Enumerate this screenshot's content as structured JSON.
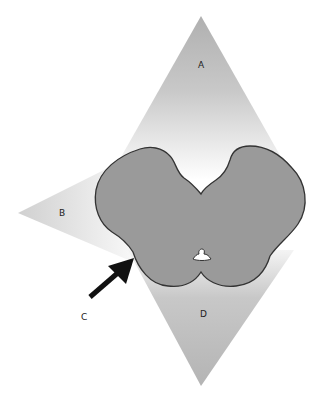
{
  "figure": {
    "labels": {
      "a": "A",
      "b": "B",
      "c": "C",
      "d": "D"
    },
    "colors": {
      "background": "#ffffff",
      "region_gray": "#b4b4b4",
      "region_light": "#f6f6f6",
      "tissue_fill": "#9a9a9a",
      "tissue_outline": "#333333",
      "arrow": "#111111"
    },
    "elements": [
      {
        "id": "A",
        "type": "triangle-region",
        "position": "top"
      },
      {
        "id": "B",
        "type": "triangle-region",
        "position": "left"
      },
      {
        "id": "C",
        "type": "arrow",
        "position": "lower-left",
        "points_to": "left lateral edge of tissue"
      },
      {
        "id": "D",
        "type": "triangle-region",
        "position": "bottom"
      }
    ]
  }
}
